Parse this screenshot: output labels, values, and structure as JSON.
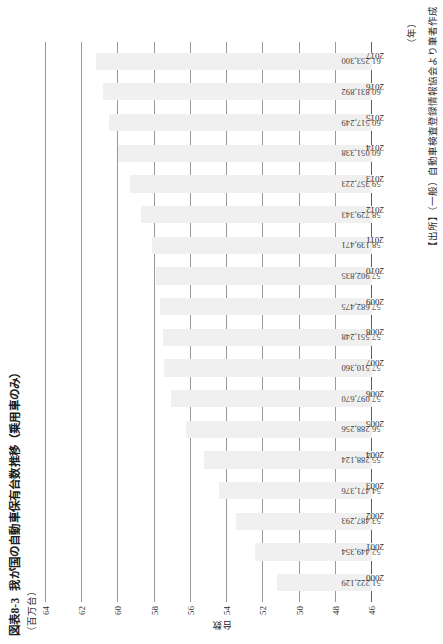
{
  "figure": {
    "number": "図表8-3",
    "title": "我が国の自動車保有台数推移（乗用車のみ）"
  },
  "source": {
    "text": "【出所】（一般）自動車検査登録情報協会より筆者作成"
  },
  "axes": {
    "unit_label": "（百万台）",
    "category_axis_caption": "（年）",
    "value_axis_title": "台数"
  },
  "chart_data": {
    "type": "bar",
    "title": "我が国の自動車保有台数推移（乗用車のみ）",
    "xlabel": "（年）",
    "ylabel": "台数",
    "unit": "百万台",
    "ylim": [
      46,
      64
    ],
    "yticks": [
      46,
      48,
      50,
      52,
      54,
      56,
      58,
      60,
      62,
      64
    ],
    "grid": true,
    "legend": false,
    "bar_color": "#f0f0f0",
    "categories": [
      "2000",
      "2001",
      "2002",
      "2003",
      "2004",
      "2005",
      "2006",
      "2007",
      "2008",
      "2009",
      "2010",
      "2011",
      "2012",
      "2013",
      "2014",
      "2015",
      "2016",
      "2017"
    ],
    "values": [
      51222129,
      52449354,
      53487293,
      54471376,
      55288124,
      56288256,
      57097670,
      57510360,
      57551248,
      57682475,
      57902835,
      58139471,
      58729343,
      59357223,
      60051338,
      60517249,
      60831892,
      61253300
    ],
    "value_labels": [
      "51,222,129",
      "52,449,354",
      "53,487,293",
      "54,471,376",
      "55,288,124",
      "56,288,256",
      "57,097,670",
      "57,510,360",
      "57,551,248",
      "57,682,475",
      "57,902,835",
      "58,139,471",
      "58,729,343",
      "59,357,223",
      "60,051,338",
      "60,517,249",
      "60,831,892",
      "61,253,300"
    ]
  }
}
